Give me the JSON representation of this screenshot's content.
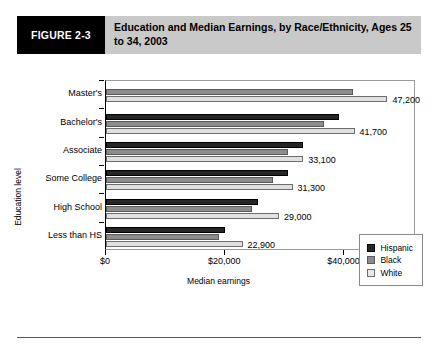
{
  "figure": {
    "badge": "FIGURE 2-3",
    "title": "Education and Median Earnings, by Race/Ethnicity, Ages 25 to 34, 2003"
  },
  "colors": {
    "badge_bg": "#000000",
    "title_bg": "#c9c9c9",
    "hispanic": "#262626",
    "black": "#8c8c8c",
    "white": "#e0e0e0"
  },
  "legend": {
    "position": "bottom-right",
    "items": [
      {
        "label": "Hispanic",
        "key": "hispanic"
      },
      {
        "label": "Black",
        "key": "black"
      },
      {
        "label": "White",
        "key": "white"
      }
    ]
  },
  "chart_data": {
    "type": "bar",
    "orientation": "horizontal",
    "title": "Education and Median Earnings, by Race/Ethnicity, Ages 25 to 34, 2003",
    "xlabel": "Median earnings",
    "ylabel": "Education level",
    "categories": [
      "Master's",
      "Bachelor's",
      "Associate",
      "Some College",
      "High School",
      "Less than HS"
    ],
    "series": [
      {
        "name": "Hispanic",
        "values": [
          null,
          39000,
          33000,
          30500,
          25500,
          20000
        ]
      },
      {
        "name": "Black",
        "values": [
          41500,
          36500,
          30500,
          28000,
          24500,
          19000
        ]
      },
      {
        "name": "White",
        "values": [
          47200,
          41700,
          33100,
          31300,
          29000,
          22900
        ]
      }
    ],
    "value_labels": [
      "47,200",
      "41,700",
      "33,100",
      "31,300",
      "29,000",
      "22,900"
    ],
    "value_label_series": "White",
    "xlim": [
      0,
      52000
    ],
    "xticks": [
      0,
      20000,
      40000
    ],
    "xtick_labels": [
      "$0",
      "$20,000",
      "$40,000"
    ],
    "grid": false
  }
}
